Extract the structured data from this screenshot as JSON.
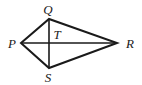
{
  "diagram": {
    "type": "kite-quadrilateral",
    "vertices": [
      {
        "name": "Q",
        "x": 49,
        "y": 19,
        "label_x": 48,
        "label_y": 14
      },
      {
        "name": "R",
        "x": 117,
        "y": 43,
        "label_x": 130,
        "label_y": 48
      },
      {
        "name": "S",
        "x": 49,
        "y": 68,
        "label_x": 48,
        "label_y": 82
      },
      {
        "name": "P",
        "x": 21,
        "y": 43,
        "label_x": 12,
        "label_y": 48
      }
    ],
    "intersection": {
      "name": "T",
      "x": 49,
      "y": 43,
      "label_x": 57,
      "label_y": 39
    },
    "sides": [
      "PQ",
      "QR",
      "RS",
      "SP"
    ],
    "diagonals": [
      "PR",
      "QS"
    ],
    "stroke_color": "#1a1a1a",
    "background": "#ffffff"
  }
}
